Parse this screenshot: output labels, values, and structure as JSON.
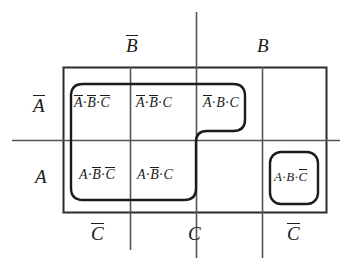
{
  "diagram": {
    "type": "karnaugh-map",
    "line_color": "#2b2b2b",
    "text_color": "#1b1b1b"
  },
  "axis": {
    "top": [
      {
        "name": "top-label-b-bar",
        "var": "B",
        "bar": true
      },
      {
        "name": "top-label-b",
        "var": "B",
        "bar": false
      }
    ],
    "bottom": [
      {
        "name": "bottom-label-c-bar-left",
        "var": "C",
        "bar": true
      },
      {
        "name": "bottom-label-c",
        "var": "C",
        "bar": false
      },
      {
        "name": "bottom-label-c-bar-right",
        "var": "C",
        "bar": true
      }
    ],
    "left": [
      {
        "name": "left-label-a-bar",
        "var": "A",
        "bar": true
      },
      {
        "name": "left-label-a",
        "var": "A",
        "bar": false
      }
    ]
  },
  "cells": [
    {
      "id": "cell-r1c1",
      "row": 0,
      "col": 0,
      "terms": [
        {
          "var": "A",
          "bar": true
        },
        {
          "var": "B",
          "bar": true
        },
        {
          "var": "C",
          "bar": true
        }
      ],
      "text": "Ā·B̄·C̄",
      "filled": true
    },
    {
      "id": "cell-r1c2",
      "row": 0,
      "col": 1,
      "terms": [
        {
          "var": "A",
          "bar": true
        },
        {
          "var": "B",
          "bar": true
        },
        {
          "var": "C",
          "bar": false
        }
      ],
      "text": "Ā·B̄·C",
      "filled": true
    },
    {
      "id": "cell-r1c3",
      "row": 0,
      "col": 2,
      "terms": [
        {
          "var": "A",
          "bar": true
        },
        {
          "var": "B",
          "bar": false
        },
        {
          "var": "C",
          "bar": false
        }
      ],
      "text": "Ā·B·C",
      "filled": true
    },
    {
      "id": "cell-r1c4",
      "row": 0,
      "col": 3,
      "terms": [],
      "text": "",
      "filled": false
    },
    {
      "id": "cell-r2c1",
      "row": 1,
      "col": 0,
      "terms": [
        {
          "var": "A",
          "bar": false
        },
        {
          "var": "B",
          "bar": true
        },
        {
          "var": "C",
          "bar": true
        }
      ],
      "text": "A·B̄·C̄",
      "filled": true
    },
    {
      "id": "cell-r2c2",
      "row": 1,
      "col": 1,
      "terms": [
        {
          "var": "A",
          "bar": false
        },
        {
          "var": "B",
          "bar": true
        },
        {
          "var": "C",
          "bar": false
        }
      ],
      "text": "A·B̄·C",
      "filled": true
    },
    {
      "id": "cell-r2c3",
      "row": 1,
      "col": 2,
      "terms": [],
      "text": "",
      "filled": false
    },
    {
      "id": "cell-r2c4",
      "row": 1,
      "col": 3,
      "terms": [
        {
          "var": "A",
          "bar": false
        },
        {
          "var": "B",
          "bar": false
        },
        {
          "var": "C",
          "bar": true
        }
      ],
      "text": "A·B·C̄",
      "filled": true
    }
  ],
  "groups": [
    {
      "id": "group-step-loop",
      "name": "grouping-loop-main",
      "shape": "step",
      "covers": [
        "cell-r1c1",
        "cell-r1c2",
        "cell-r1c3",
        "cell-r2c1",
        "cell-r2c2"
      ]
    },
    {
      "id": "group-isolated-loop",
      "name": "grouping-loop-isolated",
      "shape": "rounded-rect",
      "covers": [
        "cell-r2c4"
      ]
    }
  ]
}
